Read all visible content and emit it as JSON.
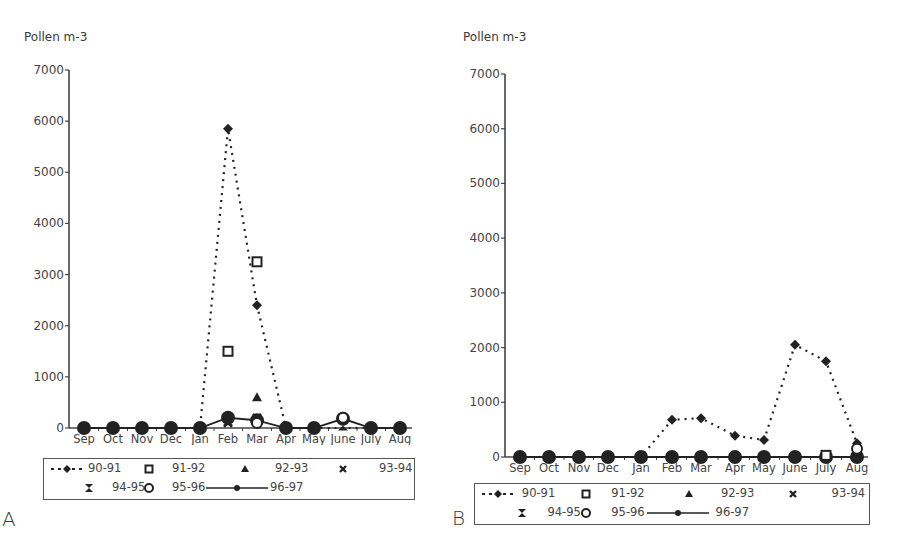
{
  "chart_data": [
    {
      "panel": "A",
      "type": "line",
      "title": "",
      "ylabel": "Pollen m-3",
      "xlabel": "",
      "ylim": [
        0,
        7000
      ],
      "yticks": [
        0,
        1000,
        2000,
        3000,
        4000,
        5000,
        6000,
        7000
      ],
      "categories": [
        "Sep",
        "Oct",
        "Nov",
        "Dec",
        "Jan",
        "Feb",
        "Mar",
        "Apr",
        "May",
        "June",
        "July",
        "Aug"
      ],
      "grid": false,
      "legend_position": "bottom (boxed)",
      "series": [
        {
          "name": "90-91",
          "style": "dashed-diamond",
          "values": [
            0,
            0,
            0,
            0,
            0,
            5850,
            2400,
            0,
            0,
            0,
            0,
            0
          ]
        },
        {
          "name": "91-92",
          "style": "square",
          "values": [
            0,
            0,
            0,
            0,
            0,
            1500,
            3250,
            0,
            0,
            0,
            0,
            0
          ]
        },
        {
          "name": "92-93",
          "style": "triangle",
          "values": [
            0,
            0,
            0,
            0,
            0,
            0,
            600,
            0,
            0,
            0,
            0,
            0
          ]
        },
        {
          "name": "93-94",
          "style": "x",
          "values": [
            0,
            0,
            0,
            0,
            0,
            100,
            200,
            0,
            0,
            0,
            0,
            0
          ]
        },
        {
          "name": "94-95",
          "style": "hourglass",
          "values": [
            0,
            0,
            0,
            0,
            0,
            150,
            0,
            0,
            0,
            50,
            0,
            0
          ]
        },
        {
          "name": "95-96",
          "style": "circle",
          "values": [
            0,
            0,
            0,
            0,
            0,
            0,
            100,
            0,
            0,
            200,
            0,
            0
          ]
        },
        {
          "name": "96-97",
          "style": "solid-dot",
          "values": [
            0,
            0,
            0,
            0,
            0,
            200,
            150,
            0,
            0,
            180,
            0,
            0
          ]
        }
      ]
    },
    {
      "panel": "B",
      "type": "line",
      "title": "",
      "ylabel": "Pollen m-3",
      "xlabel": "",
      "ylim": [
        0,
        7000
      ],
      "yticks": [
        0,
        1000,
        2000,
        3000,
        4000,
        5000,
        6000,
        7000
      ],
      "categories": [
        "Sep",
        "Oct",
        "Nov",
        "Dec",
        "Jan",
        "Feb",
        "Mar",
        "Apr",
        "May",
        "June",
        "July",
        "Aug"
      ],
      "grid": false,
      "legend_position": "bottom (boxed)",
      "series": [
        {
          "name": "90-91",
          "style": "dashed-diamond",
          "values": [
            0,
            0,
            0,
            0,
            0,
            680,
            710,
            390,
            310,
            2050,
            1750,
            250
          ]
        },
        {
          "name": "91-92",
          "style": "square",
          "values": [
            0,
            0,
            0,
            0,
            0,
            0,
            0,
            0,
            0,
            0,
            30,
            0
          ]
        },
        {
          "name": "92-93",
          "style": "triangle",
          "values": [
            0,
            0,
            0,
            0,
            0,
            0,
            0,
            0,
            0,
            0,
            0,
            80
          ]
        },
        {
          "name": "93-94",
          "style": "x",
          "values": [
            0,
            0,
            0,
            0,
            0,
            0,
            0,
            0,
            0,
            0,
            0,
            0
          ]
        },
        {
          "name": "94-95",
          "style": "hourglass",
          "values": [
            0,
            0,
            0,
            0,
            0,
            0,
            0,
            0,
            0,
            0,
            0,
            0
          ]
        },
        {
          "name": "95-96",
          "style": "circle",
          "values": [
            0,
            0,
            0,
            0,
            0,
            0,
            0,
            0,
            0,
            0,
            0,
            150
          ]
        },
        {
          "name": "96-97",
          "style": "solid-dot",
          "values": [
            0,
            0,
            0,
            0,
            0,
            0,
            0,
            0,
            0,
            0,
            0,
            0
          ]
        }
      ]
    }
  ],
  "panels": {
    "A": {
      "letter": "A",
      "ylabel": "Pollen m-3"
    },
    "B": {
      "letter": "B",
      "ylabel": "Pollen m-3"
    }
  },
  "legend": {
    "row1": [
      "90-91",
      "91-92",
      "92-93",
      "93-94"
    ],
    "row2": [
      "94-95",
      "95-96",
      "96-97"
    ]
  },
  "colors": {
    "ink": "#222222",
    "axis": "#444444",
    "text": "#444444",
    "background": "#ffffff"
  }
}
